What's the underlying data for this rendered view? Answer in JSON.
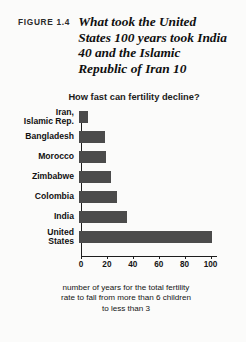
{
  "figure": {
    "label": "FIGURE 1.4",
    "title": "What took the United States 100 years took India 40 and the Islamic Republic of Iran 10"
  },
  "colors": {
    "bar": "#4b4b4b",
    "axis": "#1d1d1d",
    "background": "#fbfbfa",
    "text": "#111111"
  },
  "chart_data": {
    "type": "bar",
    "orientation": "horizontal",
    "title": "How fast can fertility decline?",
    "categories": [
      "Iran,\nIslamic Rep.",
      "Bangladesh",
      "Morocco",
      "Zimbabwe",
      "Colombia",
      "India",
      "United\nStates"
    ],
    "values": [
      7,
      20,
      21,
      25,
      29,
      37,
      103
    ],
    "xlabel": "number of years for the total fertility rate to fall from more than 6 children to less than 3",
    "ylabel": "",
    "xlim": [
      0,
      105
    ],
    "xticks": [
      0,
      20,
      40,
      60,
      80,
      100
    ],
    "xtick_labels": [
      "0",
      "20",
      "40",
      "60",
      "80",
      "100"
    ],
    "grid": false,
    "legend": false
  },
  "caption": {
    "line1": "number of years for the total fertility",
    "line2": "rate to fall from more than 6 children",
    "line3": "to less than 3"
  }
}
